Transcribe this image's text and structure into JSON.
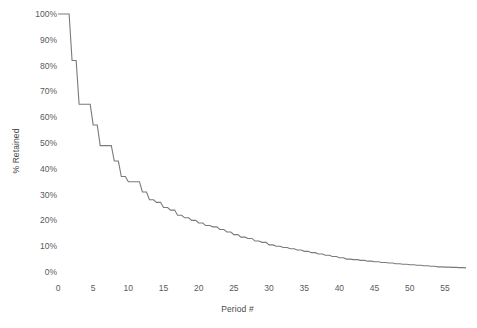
{
  "chart_data": {
    "type": "line",
    "title": "",
    "xlabel": "Period #",
    "ylabel": "% Retained",
    "xlim": [
      0,
      58
    ],
    "ylim": [
      0,
      100
    ],
    "grid": false,
    "legend": false,
    "line_color": "#7a7a7a",
    "background": "#ffffff",
    "x_ticks": [
      0,
      5,
      10,
      15,
      20,
      25,
      30,
      35,
      40,
      45,
      50,
      55
    ],
    "x_tick_labels": [
      "0",
      "5",
      "10",
      "15",
      "20",
      "25",
      "30",
      "35",
      "40",
      "45",
      "50",
      "55"
    ],
    "y_ticks": [
      0,
      10,
      20,
      30,
      40,
      50,
      60,
      70,
      80,
      90,
      100
    ],
    "y_tick_labels": [
      "0%",
      "10%",
      "20%",
      "30%",
      "40%",
      "50%",
      "60%",
      "70%",
      "80%",
      "90%",
      "100%"
    ],
    "series": [
      {
        "name": "% Retained",
        "x": [
          0,
          1,
          2,
          3,
          4,
          5,
          6,
          7,
          8,
          9,
          10,
          11,
          12,
          13,
          14,
          15,
          16,
          17,
          18,
          19,
          20,
          21,
          22,
          23,
          24,
          25,
          26,
          27,
          28,
          29,
          30,
          31,
          32,
          33,
          34,
          35,
          36,
          37,
          38,
          39,
          40,
          41,
          42,
          43,
          44,
          45,
          46,
          47,
          48,
          49,
          50,
          51,
          52,
          53,
          54,
          55,
          56,
          57,
          58
        ],
        "values": [
          100,
          100,
          82,
          65,
          65,
          57,
          49,
          49,
          43,
          37,
          35,
          35,
          31,
          28,
          27,
          25,
          24,
          22,
          21,
          20,
          19,
          18,
          17.5,
          16.5,
          15.5,
          14.5,
          13.5,
          13,
          12,
          11.5,
          10.5,
          10,
          9.5,
          9,
          8.5,
          8,
          7.5,
          7,
          6.5,
          6,
          5.5,
          5,
          4.8,
          4.5,
          4.2,
          4,
          3.7,
          3.5,
          3.2,
          3,
          2.8,
          2.6,
          2.4,
          2.2,
          2,
          1.9,
          1.8,
          1.7,
          1.6
        ]
      }
    ]
  }
}
